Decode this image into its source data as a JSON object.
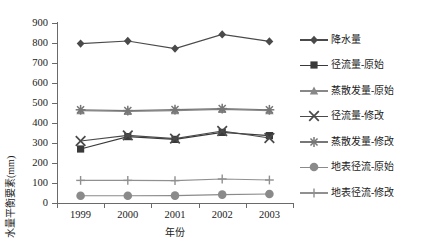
{
  "chart_data": {
    "type": "line",
    "title": "",
    "subtitle": "",
    "xlabel": "年份",
    "ylabel": "水量平衡要素(mm)",
    "categories": [
      "1999",
      "2000",
      "2001",
      "2002",
      "2003"
    ],
    "ylim": [
      0,
      900
    ],
    "yticks": [
      0,
      100,
      200,
      300,
      400,
      500,
      600,
      700,
      800,
      900
    ],
    "ytick_labels": [
      "0",
      "100",
      "200",
      "300",
      "400",
      "500",
      "600",
      "700",
      "800",
      "900"
    ],
    "grid": false,
    "legend_position": "right",
    "series": [
      {
        "name": "降水量",
        "marker": "diamond",
        "color": "#4a4a4a",
        "values": [
          797,
          810,
          772,
          843,
          808
        ]
      },
      {
        "name": "径流量-原始",
        "marker": "square",
        "color": "#3a3a3a",
        "values": [
          270,
          332,
          318,
          353,
          337
        ]
      },
      {
        "name": "蒸散发量-原始",
        "marker": "triangle",
        "color": "#888888",
        "values": [
          462,
          458,
          462,
          468,
          462
        ]
      },
      {
        "name": "径流量-修改",
        "marker": "x",
        "color": "#4a4a4a",
        "values": [
          310,
          338,
          322,
          360,
          325
        ]
      },
      {
        "name": "蒸散发量-修改",
        "marker": "star",
        "color": "#777777",
        "values": [
          466,
          462,
          467,
          472,
          466
        ]
      },
      {
        "name": "地表径流-原始",
        "marker": "circle",
        "color": "#8a8a8a",
        "values": [
          36,
          36,
          37,
          42,
          45
        ]
      },
      {
        "name": "地表径流-修改",
        "marker": "plus",
        "color": "#909090",
        "values": [
          113,
          113,
          112,
          120,
          115
        ]
      }
    ]
  },
  "legend": {
    "items": [
      {
        "label": "降水量",
        "marker": "diamond",
        "color": "#4a4a4a"
      },
      {
        "label": "径流量-原始",
        "marker": "square",
        "color": "#3a3a3a"
      },
      {
        "label": "蒸散发量-原始",
        "marker": "triangle",
        "color": "#888888"
      },
      {
        "label": "径流量-修改",
        "marker": "x",
        "color": "#4a4a4a"
      },
      {
        "label": "蒸散发量-修改",
        "marker": "star",
        "color": "#777777"
      },
      {
        "label": "地表径流-原始",
        "marker": "circle",
        "color": "#8a8a8a"
      },
      {
        "label": "地表径流-修改",
        "marker": "plus",
        "color": "#909090"
      }
    ]
  }
}
